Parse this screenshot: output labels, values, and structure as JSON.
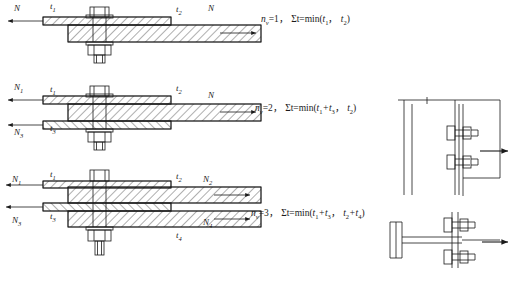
{
  "figure": {
    "background": "#ffffff",
    "line_color": "#1a1a1a"
  },
  "rows": [
    {
      "id": "single-shear",
      "n_shear_planes": 1,
      "formula": "n",
      "formula_sub": "v",
      "formula_rest": "=1, Σt=min(t",
      "formula_full": "n_v=1,  Σt=min(t1,  t2)",
      "force_labels": [
        {
          "name": "force-left",
          "text": "N",
          "sub": "",
          "x": 14,
          "y": 5
        },
        {
          "name": "force-right",
          "text": "N",
          "sub": "",
          "x": 208,
          "y": 5
        }
      ],
      "thickness_labels": [
        {
          "name": "thickness-t1",
          "text": "t",
          "sub": "1",
          "x": 50,
          "y": 2
        },
        {
          "name": "thickness-t2",
          "text": "t",
          "sub": "2",
          "x": 176,
          "y": 5
        }
      ]
    },
    {
      "id": "double-shear",
      "n_shear_planes": 2,
      "formula_full": "n_v=2,  Σt=min(t1+t3,  t2)",
      "force_labels": [
        {
          "name": "force-left-n1",
          "text": "N",
          "sub": "1",
          "x": 14,
          "y": 84
        },
        {
          "name": "force-left-n3",
          "text": "N",
          "sub": "3",
          "x": 14,
          "y": 128
        },
        {
          "name": "force-right-n",
          "text": "N",
          "sub": "",
          "x": 208,
          "y": 91
        }
      ],
      "thickness_labels": [
        {
          "name": "thickness-t1",
          "text": "t",
          "sub": "1",
          "x": 50,
          "y": 86
        },
        {
          "name": "thickness-t2",
          "text": "t",
          "sub": "2",
          "x": 176,
          "y": 85
        },
        {
          "name": "thickness-t3",
          "text": "t",
          "sub": "3",
          "x": 50,
          "y": 123
        }
      ]
    },
    {
      "id": "triple-shear",
      "n_shear_planes": 3,
      "formula_full": "n_v=3,  Σt=min(t1+t3,  t2+t4)",
      "force_labels": [
        {
          "name": "force-left-n1",
          "text": "N",
          "sub": "1",
          "x": 12,
          "y": 176
        },
        {
          "name": "force-left-n3",
          "text": "N",
          "sub": "3",
          "x": 12,
          "y": 216
        },
        {
          "name": "force-right-n2",
          "text": "N",
          "sub": "2",
          "x": 203,
          "y": 176
        },
        {
          "name": "force-right-n4",
          "text": "N",
          "sub": "4",
          "x": 203,
          "y": 218
        }
      ],
      "thickness_labels": [
        {
          "name": "thickness-t1",
          "text": "t",
          "sub": "1",
          "x": 50,
          "y": 175
        },
        {
          "name": "thickness-t2",
          "text": "t",
          "sub": "2",
          "x": 176,
          "y": 175
        },
        {
          "name": "thickness-t3",
          "text": "t",
          "sub": "3",
          "x": 50,
          "y": 213
        },
        {
          "name": "thickness-t4",
          "text": "t",
          "sub": "4",
          "x": 176,
          "y": 231
        }
      ]
    }
  ],
  "formulas": [
    {
      "name": "formula-single-shear",
      "x": 261,
      "y": 15,
      "n_symbol": "n",
      "n_sub": "v",
      "n_value": "=1，",
      "sum": "Σt=min(",
      "arg1": "t",
      "arg1_sub": "1",
      "sep": "， ",
      "arg2": "t",
      "arg2_sub": "2",
      "close": ")"
    },
    {
      "name": "formula-double-shear",
      "x": 255,
      "y": 104,
      "n_symbol": "n",
      "n_sub": "v",
      "n_value": "=2，",
      "sum": "Σt=min(",
      "arg1": "t",
      "arg1_sub": "1",
      "arg1_extra": "+t",
      "arg1_extra_sub": "3",
      "sep": "， ",
      "arg2": "t",
      "arg2_sub": "2",
      "close": ")"
    },
    {
      "name": "formula-triple-shear",
      "x": 251,
      "y": 209,
      "n_symbol": "n",
      "n_sub": "v",
      "n_value": "=3，",
      "sum": "Σt=min(",
      "arg1": "t",
      "arg1_sub": "1",
      "arg1_extra": "+t",
      "arg1_extra_sub": "3",
      "sep": "， ",
      "arg2": "t",
      "arg2_sub": "2",
      "arg2_extra": "+t",
      "arg2_extra_sub": "4",
      "close": ")"
    }
  ],
  "detail_views": [
    {
      "name": "detail-elevation-bolted-beam-column",
      "description": "beam to column web elevation with two bolts and load arrow",
      "bolt_count": 2
    },
    {
      "name": "detail-plan-tee-connection",
      "description": "tee section plan view with two bolts and load arrow",
      "bolt_count": 2
    }
  ]
}
